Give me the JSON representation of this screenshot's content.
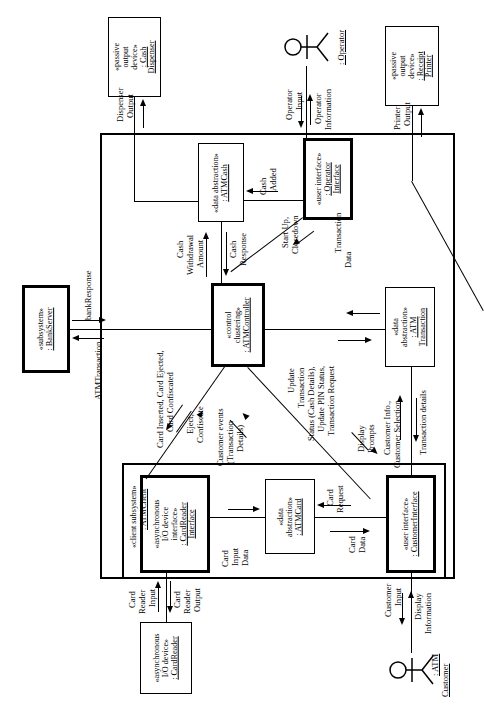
{
  "diagram": {
    "type": "uml-communication-diagram",
    "orientation": "rotated-90-ccw"
  },
  "boundaries": {
    "atm_system": "ATM System",
    "atm_client": {
      "stereotype": "«client subsystem»",
      "name": ": ATMClient"
    }
  },
  "actors": {
    "operator": {
      "name": ": Operator"
    },
    "customer": {
      "line1": ": ATM",
      "line2": "Customer"
    }
  },
  "objects": {
    "cash_dispenser": {
      "s1": "«passive",
      "s2": "output",
      "s3": "device»",
      "n1": ": Cash",
      "n2": "Dispenser"
    },
    "receipt_printer": {
      "s1": "«passive",
      "s2": "output",
      "s3": "device»",
      "n1": ": Receipt",
      "n2": "Printer"
    },
    "card_reader": {
      "s1": "«asynchronous",
      "s2": "I/O device»",
      "n1": ": CardReader"
    },
    "atm_cash": {
      "s1": "«data abstraction»",
      "n1": ": ATMCash"
    },
    "atm_card": {
      "s1": "«data",
      "s2": "abstraction»",
      "n1": ": ATMCard"
    },
    "atm_transaction": {
      "s1": "«data",
      "s2": "abstraction»",
      "n1": ": ATM",
      "n2": "Transaction"
    },
    "operator_interface": {
      "s1": "«user interface»",
      "n1": ": Operator",
      "n2": "Interface"
    },
    "customer_interface": {
      "s1": "«user interface»",
      "n1": ": CustomerInterface"
    },
    "card_reader_interface": {
      "s1": "«asynchronous",
      "s2": "I/O device",
      "s3": "interface»",
      "n1": ": CardReader",
      "n2": "Interface"
    },
    "atm_controller": {
      "s1": "«control",
      "s2": "clustering»",
      "n1": ": ATMController"
    },
    "bank_server": {
      "s1": "«subsystem»",
      "n1": ": BankServer"
    }
  },
  "messages": {
    "dispenser_output": {
      "l1": "Dispenser",
      "l2": "Output"
    },
    "printer_output": {
      "l1": "Printer",
      "l2": "Output"
    },
    "operator_input": {
      "l1": "Operator",
      "l2": "Input"
    },
    "operator_information": {
      "l1": "Operator",
      "l2": "Information"
    },
    "cash_added": {
      "l1": "Cash",
      "l2": "Added"
    },
    "cash_withdrawal_amount": {
      "l1": "Cash",
      "l2": "Withdrawal",
      "l3": "Amount"
    },
    "cash_response": {
      "l1": "Cash",
      "l2": "Response"
    },
    "start_up_closedown": {
      "l1": "Start Up,",
      "l2": "Closedown"
    },
    "transaction_data": {
      "l1": "Transaction",
      "l2": "Data"
    },
    "bank_response": {
      "l1": "bankResponse"
    },
    "atm_transaction_msg": {
      "l1": "ATMTransaction"
    },
    "card_inserted": {
      "l1": "Card Inserted, Card Ejected,",
      "l2": "Card Confiscated"
    },
    "eject_confiscate": {
      "l1": "Eject,",
      "l2": "Confiscate"
    },
    "customer_events": {
      "l1": "Customer events",
      "l2": "(Transaction",
      "l3": "Details)"
    },
    "update_transaction": {
      "l1": "Update",
      "l2": "Transaction",
      "l3": "Status (Cash Details),",
      "l4": "Update PIN Status,",
      "l5": "Transaction Request"
    },
    "display_prompts": {
      "l1": "Display",
      "l2": "Prompts"
    },
    "customer_info": {
      "l1": "Customer Info.,",
      "l2": "Customer Selection"
    },
    "transaction_details": {
      "l1": "Transaction details"
    },
    "card_reader_input": {
      "l1": "Card",
      "l2": "Reader",
      "l3": "Input"
    },
    "card_reader_output": {
      "l1": "Card",
      "l2": "Reader",
      "l3": "Output"
    },
    "card_input_data": {
      "l1": "Card",
      "l2": "Input",
      "l3": "Data"
    },
    "card_request": {
      "l1": "Card",
      "l2": "Request"
    },
    "card_data": {
      "l1": "Card",
      "l2": "Data"
    },
    "customer_input": {
      "l1": "Customer",
      "l2": "Input"
    },
    "display_information": {
      "l1": "Display",
      "l2": "Information"
    }
  },
  "colors": {
    "stroke": "#000000",
    "background": "#ffffff"
  }
}
